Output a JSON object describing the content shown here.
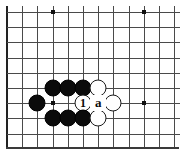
{
  "figure": {
    "caption": "",
    "board": {
      "background_color": "#ffffff",
      "line_color": "#4a4a4a",
      "edge_color": "#222222",
      "cell_size": 15.2,
      "origin_x": 7,
      "origin_y": 12,
      "columns": 12,
      "rows": 9,
      "left_edge_is_board_border": true,
      "bottom_edge_is_board_border": true
    },
    "star_points": [
      {
        "name": "star-point-top-left",
        "col": 3,
        "row": 0
      },
      {
        "name": "star-point-top-right",
        "col": 9,
        "row": 0
      },
      {
        "name": "star-point-middle-left",
        "col": 3,
        "row": 6
      },
      {
        "name": "star-point-middle-right",
        "col": 9,
        "row": 6
      }
    ],
    "stones": [
      {
        "name": "black-stone-d6",
        "color": "black",
        "col": 3,
        "row": 5,
        "label": ""
      },
      {
        "name": "black-stone-e6",
        "color": "black",
        "col": 4,
        "row": 5,
        "label": ""
      },
      {
        "name": "black-stone-f6",
        "color": "black",
        "col": 5,
        "row": 5,
        "label": ""
      },
      {
        "name": "white-stone-g6",
        "color": "white",
        "col": 6,
        "row": 5,
        "label": ""
      },
      {
        "name": "black-stone-c7",
        "color": "black",
        "col": 2,
        "row": 6,
        "label": ""
      },
      {
        "name": "white-stone-move-1",
        "color": "white",
        "col": 5,
        "row": 6,
        "label": "1"
      },
      {
        "name": "white-stone-h7",
        "color": "white",
        "col": 7,
        "row": 6,
        "label": ""
      },
      {
        "name": "black-stone-d8",
        "color": "black",
        "col": 3,
        "row": 7,
        "label": ""
      },
      {
        "name": "black-stone-e8",
        "color": "black",
        "col": 4,
        "row": 7,
        "label": ""
      },
      {
        "name": "black-stone-f8",
        "color": "black",
        "col": 5,
        "row": 7,
        "label": ""
      },
      {
        "name": "white-stone-g8",
        "color": "white",
        "col": 6,
        "row": 7,
        "label": ""
      }
    ],
    "point_labels": [
      {
        "name": "point-label-a",
        "text": "a",
        "col": 6,
        "row": 6
      }
    ]
  }
}
